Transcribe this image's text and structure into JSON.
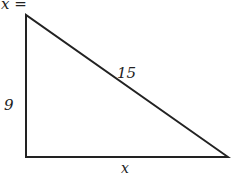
{
  "diagram": {
    "title": "x =",
    "type": "right-triangle",
    "labels": {
      "left_side": "9",
      "hypotenuse": "15",
      "bottom_side": "x"
    },
    "colors": {
      "stroke": "#222222",
      "background": "#ffffff"
    }
  }
}
